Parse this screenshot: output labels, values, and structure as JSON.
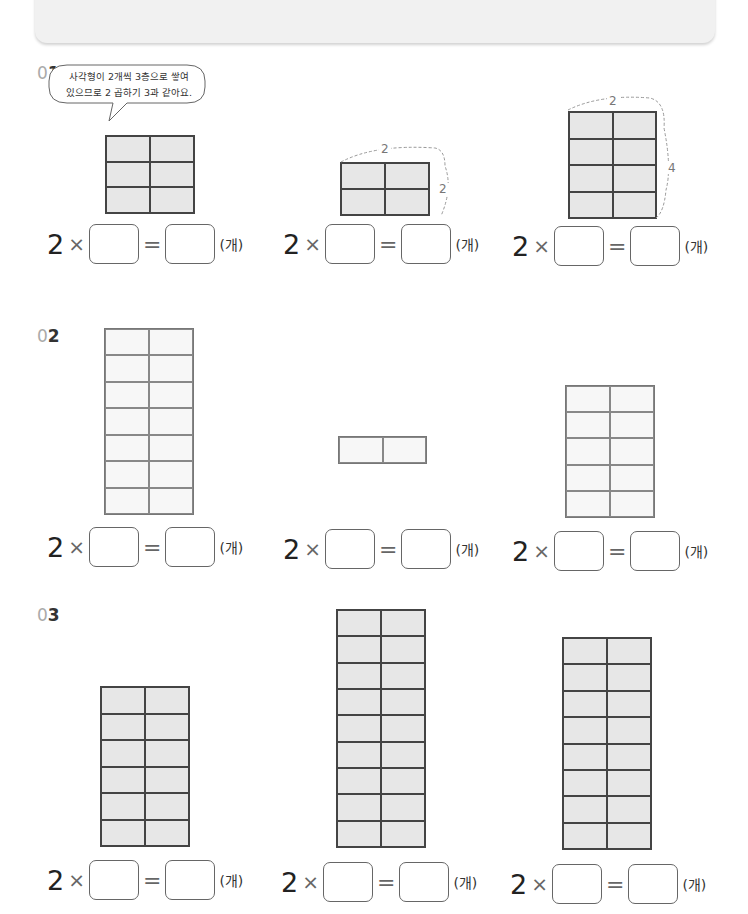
{
  "header": {
    "title": ""
  },
  "hint_bubble": {
    "line1": "사각형이 2개씩 3층으로 쌓여",
    "line2": "있으므로 2 곱하기 3과 같아요."
  },
  "equation": {
    "multiplier": "2",
    "times": "×",
    "equals": "=",
    "unit": "(개)",
    "blank1": "",
    "blank2": ""
  },
  "sections": [
    {
      "label_zero": "0",
      "label_num": "1",
      "problems": [
        {
          "columns": 2,
          "rows": 3,
          "fill": "gray",
          "top_label": "",
          "side_label": ""
        },
        {
          "columns": 2,
          "rows": 2,
          "fill": "gray",
          "top_label": "2",
          "side_label": "2"
        },
        {
          "columns": 2,
          "rows": 4,
          "fill": "gray",
          "top_label": "2",
          "side_label": "4"
        }
      ]
    },
    {
      "label_zero": "0",
      "label_num": "2",
      "problems": [
        {
          "columns": 2,
          "rows": 7,
          "fill": "light"
        },
        {
          "columns": 2,
          "rows": 1,
          "fill": "light"
        },
        {
          "columns": 2,
          "rows": 5,
          "fill": "light"
        }
      ]
    },
    {
      "label_zero": "0",
      "label_num": "3",
      "problems": [
        {
          "columns": 2,
          "rows": 6,
          "fill": "gray"
        },
        {
          "columns": 2,
          "rows": 9,
          "fill": "gray"
        },
        {
          "columns": 2,
          "rows": 8,
          "fill": "gray"
        }
      ]
    }
  ],
  "colors": {
    "grid_line": "#444444",
    "gray_fill": "#e7e7e7",
    "light_fill": "#f7f7f7",
    "label_zero": "#aaaaaa"
  }
}
